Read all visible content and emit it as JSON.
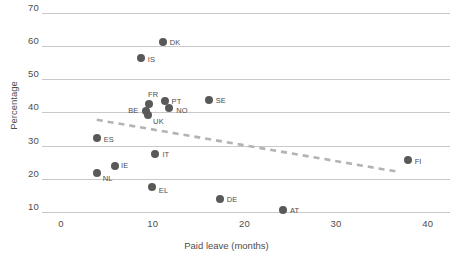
{
  "chart_data": {
    "type": "scatter",
    "title": "",
    "xlabel": "Paid leave (months)",
    "ylabel": "Percentage",
    "xlim": [
      -1,
      41
    ],
    "ylim": [
      7,
      72
    ],
    "xticks": [
      0,
      10,
      20,
      30,
      40
    ],
    "yticks": [
      10,
      20,
      30,
      40,
      50,
      60,
      70
    ],
    "grid": "horizontal",
    "legend": "none",
    "marker_color": "#595959",
    "trendline_color": "#b3b3b3",
    "gridline_color": "#c9c9c9",
    "points": [
      {
        "label": "DK",
        "x": 11.1,
        "y": 61.3,
        "label_dx": 7,
        "label_dy": -3
      },
      {
        "label": "IS",
        "x": 8.7,
        "y": 56.4,
        "label_dx": 7,
        "label_dy": -2
      },
      {
        "label": "SE",
        "x": 16.1,
        "y": 43.8,
        "label_dx": 7,
        "label_dy": -3
      },
      {
        "label": "FR",
        "x": 9.6,
        "y": 42.5,
        "label_dx": -1,
        "label_dy": -13
      },
      {
        "label": "PT",
        "x": 11.3,
        "y": 43.5,
        "label_dx": 7,
        "label_dy": -3
      },
      {
        "label": "NO",
        "x": 11.8,
        "y": 41.4,
        "label_dx": 7,
        "label_dy": -1
      },
      {
        "label": "BE",
        "x": 9.3,
        "y": 40.3,
        "label_dx": -18,
        "label_dy": -4
      },
      {
        "label": "UK",
        "x": 9.5,
        "y": 39.2,
        "label_dx": 5,
        "label_dy": 3
      },
      {
        "label": "ES",
        "x": 3.9,
        "y": 32.3,
        "label_dx": 7,
        "label_dy": -2
      },
      {
        "label": "IT",
        "x": 10.3,
        "y": 27.5,
        "label_dx": 7,
        "label_dy": -3
      },
      {
        "label": "IE",
        "x": 5.9,
        "y": 23.9,
        "label_dx": 6,
        "label_dy": -4
      },
      {
        "label": "NL",
        "x": 3.9,
        "y": 21.8,
        "label_dx": 6,
        "label_dy": 2
      },
      {
        "label": "FI",
        "x": 37.8,
        "y": 25.7,
        "label_dx": 7,
        "label_dy": -2
      },
      {
        "label": "EL",
        "x": 9.9,
        "y": 17.6,
        "label_dx": 7,
        "label_dy": 0
      },
      {
        "label": "DE",
        "x": 17.3,
        "y": 13.9,
        "label_dx": 7,
        "label_dy": -3
      },
      {
        "label": "AT",
        "x": 24.2,
        "y": 10.6,
        "label_dx": 7,
        "label_dy": -3
      }
    ],
    "trendline": {
      "x0": 3.9,
      "y0": 37.8,
      "x1": 37.0,
      "y1": 22.0,
      "style": "dashed"
    }
  }
}
